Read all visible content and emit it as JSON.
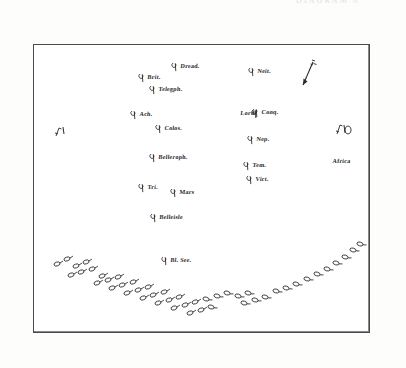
{
  "plate": {
    "top_caption": "DIAGRAM 6",
    "border_color": "#4a4a4a",
    "ink_color": "#2b2b2b",
    "paper_color": "#ffffff"
  },
  "compass": {
    "name": "wind-arrow",
    "label": "W",
    "direction": "down-left"
  },
  "fleet_line": {
    "label": "British line of battle",
    "ship_glyph": "oval-with-pennant"
  },
  "units": [
    {
      "id": "brit",
      "label": "Brit.",
      "x": 146,
      "y": 76,
      "glyph_side": "left"
    },
    {
      "id": "dread",
      "label": "Dread.",
      "x": 179,
      "y": 65,
      "glyph_side": "left"
    },
    {
      "id": "neit",
      "label": "Neit.",
      "x": 256,
      "y": 70,
      "glyph_side": "left"
    },
    {
      "id": "telegph",
      "label": "Telegph.",
      "x": 157,
      "y": 88,
      "glyph_side": "left"
    },
    {
      "id": "ach",
      "label": "Ach.",
      "x": 138,
      "y": 113,
      "glyph_side": "left"
    },
    {
      "id": "lord",
      "label": "Lord",
      "x": 239,
      "y": 112,
      "glyph_side": "right"
    },
    {
      "id": "conq",
      "label": "Conq.",
      "x": 260,
      "y": 111,
      "glyph_side": "left"
    },
    {
      "id": "colos",
      "label": "Colos.",
      "x": 163,
      "y": 127,
      "glyph_side": "left"
    },
    {
      "id": "nep",
      "label": "Nep.",
      "x": 255,
      "y": 138,
      "glyph_side": "left"
    },
    {
      "id": "belleroph",
      "label": "Belleroph.",
      "x": 157,
      "y": 156,
      "glyph_side": "left"
    },
    {
      "id": "tem",
      "label": "Tem.",
      "x": 251,
      "y": 164,
      "glyph_side": "left"
    },
    {
      "id": "vict",
      "label": "Vict.",
      "x": 254,
      "y": 178,
      "glyph_side": "left"
    },
    {
      "id": "tri",
      "label": "Tri.",
      "x": 146,
      "y": 186,
      "glyph_side": "left"
    },
    {
      "id": "mars",
      "label": "Mars",
      "x": 178,
      "y": 191,
      "glyph_side": "left"
    },
    {
      "id": "belleisle",
      "label": "Belleisle",
      "x": 158,
      "y": 216,
      "glyph_side": "left"
    },
    {
      "id": "bl-see",
      "label": "Bl. See.",
      "x": 169,
      "y": 259,
      "glyph_side": "left"
    },
    {
      "id": "africa",
      "label": "Africa",
      "x": 331,
      "y": 160,
      "glyph_side": "none"
    }
  ],
  "edge_marks": [
    {
      "id": "left-mark",
      "label": "S.",
      "x": 55,
      "y": 127
    },
    {
      "id": "right-mark",
      "label": "N.",
      "x": 336,
      "y": 126
    }
  ],
  "arc_ships": {
    "count": 47,
    "description": "crescent formation of small ship symbols",
    "points": [
      [
        57,
        264
      ],
      [
        67,
        259
      ],
      [
        76,
        266
      ],
      [
        86,
        262
      ],
      [
        71,
        275
      ],
      [
        81,
        272
      ],
      [
        92,
        269
      ],
      [
        102,
        276
      ],
      [
        97,
        283
      ],
      [
        108,
        280
      ],
      [
        118,
        277
      ],
      [
        112,
        288
      ],
      [
        122,
        285
      ],
      [
        133,
        282
      ],
      [
        127,
        293
      ],
      [
        138,
        290
      ],
      [
        148,
        287
      ],
      [
        143,
        298
      ],
      [
        153,
        295
      ],
      [
        164,
        292
      ],
      [
        158,
        303
      ],
      [
        169,
        300
      ],
      [
        179,
        297
      ],
      [
        174,
        308
      ],
      [
        185,
        305
      ],
      [
        195,
        302
      ],
      [
        190,
        313
      ],
      [
        201,
        310
      ],
      [
        211,
        307
      ],
      [
        206,
        299
      ],
      [
        217,
        296
      ],
      [
        227,
        293
      ],
      [
        238,
        296
      ],
      [
        248,
        293
      ],
      [
        244,
        303
      ],
      [
        255,
        300
      ],
      [
        265,
        297
      ],
      [
        276,
        291
      ],
      [
        286,
        288
      ],
      [
        296,
        284
      ],
      [
        307,
        279
      ],
      [
        317,
        274
      ],
      [
        327,
        269
      ],
      [
        336,
        263
      ],
      [
        345,
        257
      ],
      [
        353,
        250
      ],
      [
        360,
        244
      ]
    ]
  }
}
